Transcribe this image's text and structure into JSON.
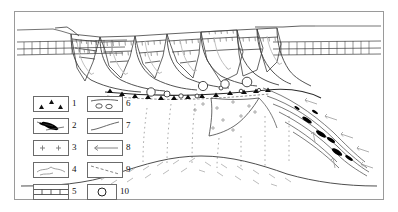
{
  "figure": {
    "border_color": "#9a9a9a",
    "line_color": "#333333",
    "fault_color": "#555555",
    "accent_color": "#000000"
  },
  "legend": {
    "columns": 2,
    "items": [
      {
        "number": "1",
        "symbol": "triangles-breccia",
        "meaning": "fault breccia / conglomerate with angular clasts"
      },
      {
        "number": "2",
        "symbol": "black-lenses-mylonite",
        "meaning": "mylonite lenses / boudins"
      },
      {
        "number": "3",
        "symbol": "plus-granite",
        "meaning": "granite intrusion"
      },
      {
        "number": "4",
        "symbol": "irregular-lines-schist",
        "meaning": "schist / gneiss basement"
      },
      {
        "number": "5",
        "symbol": "horizontal-strata",
        "meaning": "layered sedimentary strata"
      },
      {
        "number": "6",
        "symbol": "pebbles-conglomerate",
        "meaning": "conglomerate with rounded pebbles"
      },
      {
        "number": "7",
        "symbol": "curved-line-contact",
        "meaning": "stratigraphic contact"
      },
      {
        "number": "8",
        "symbol": "arrow-line-movement",
        "meaning": "sense of movement"
      },
      {
        "number": "9",
        "symbol": "dashed-line-foliation",
        "meaning": "foliation / inferred contact"
      },
      {
        "number": "10",
        "symbol": "circle-clast",
        "meaning": "rounded clast"
      }
    ]
  },
  "diagram": {
    "fault_blocks": 7,
    "detachment_label": "detachment-fault",
    "shear_zone_label": "mylonitic-shear-zone",
    "pluton_label": "granite-pluton",
    "dome_label": "basement-dome"
  }
}
